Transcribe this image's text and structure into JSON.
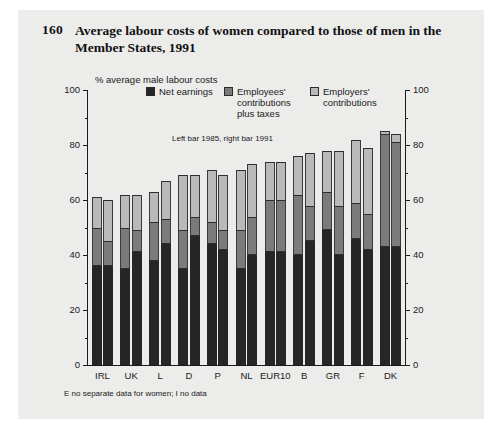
{
  "figure": {
    "number": "160",
    "title": "Average labour costs of women compared to those of men in the Member States, 1991",
    "axis_caption": "% average male labour costs",
    "subnote": "Left bar 1985, right bar 1991",
    "footnote": "E no separate data for women; I no data"
  },
  "legend": {
    "items": [
      {
        "label": "Net earnings",
        "color": "#262626"
      },
      {
        "label": "Employees' contributions plus taxes",
        "color": "#7b7b7b"
      },
      {
        "label": "Employers' contributions",
        "color": "#b9b9b9"
      }
    ]
  },
  "axis": {
    "left_ticks": [
      "100",
      "80",
      "60",
      "40",
      "20",
      "0"
    ],
    "right_ticks": [
      "100",
      "80",
      "60",
      "40",
      "20",
      "0"
    ]
  },
  "chart_data": {
    "type": "bar",
    "title": "Average labour costs of women compared to those of men in the Member States, 1991",
    "subtitle": "Left bar 1985, right bar 1991",
    "xlabel": "",
    "ylabel": "% average male labour costs",
    "ylim": [
      0,
      100
    ],
    "ytick_step": 20,
    "grid": false,
    "stacked": true,
    "legend_position": "top",
    "categories": [
      "IRL",
      "UK",
      "L",
      "D",
      "P",
      "NL",
      "EUR10",
      "B",
      "GR",
      "F",
      "DK"
    ],
    "bar_groups": [
      {
        "category": "IRL",
        "bars": [
          {
            "year": "1985",
            "net_earnings": 36,
            "employees_contributions_plus_taxes": 14,
            "employers_contributions": 11,
            "total": 61
          },
          {
            "year": "1991",
            "net_earnings": 36,
            "employees_contributions_plus_taxes": 9,
            "employers_contributions": 15,
            "total": 60
          }
        ]
      },
      {
        "category": "UK",
        "bars": [
          {
            "year": "1985",
            "net_earnings": 35,
            "employees_contributions_plus_taxes": 15,
            "employers_contributions": 12,
            "total": 62
          },
          {
            "year": "1991",
            "net_earnings": 41,
            "employees_contributions_plus_taxes": 8,
            "employers_contributions": 13,
            "total": 62
          }
        ]
      },
      {
        "category": "L",
        "bars": [
          {
            "year": "1985",
            "net_earnings": 38,
            "employees_contributions_plus_taxes": 14,
            "employers_contributions": 11,
            "total": 63
          },
          {
            "year": "1991",
            "net_earnings": 44,
            "employees_contributions_plus_taxes": 9,
            "employers_contributions": 14,
            "total": 67
          }
        ]
      },
      {
        "category": "D",
        "bars": [
          {
            "year": "1985",
            "net_earnings": 35,
            "employees_contributions_plus_taxes": 14,
            "employers_contributions": 20,
            "total": 69
          },
          {
            "year": "1991",
            "net_earnings": 47,
            "employees_contributions_plus_taxes": 7,
            "employers_contributions": 15,
            "total": 69
          }
        ]
      },
      {
        "category": "P",
        "bars": [
          {
            "year": "1985",
            "net_earnings": 44,
            "employees_contributions_plus_taxes": 8,
            "employers_contributions": 19,
            "total": 71
          },
          {
            "year": "1991",
            "net_earnings": 42,
            "employees_contributions_plus_taxes": 7,
            "employers_contributions": 20,
            "total": 69
          }
        ]
      },
      {
        "category": "NL",
        "bars": [
          {
            "year": "1985",
            "net_earnings": 35,
            "employees_contributions_plus_taxes": 14,
            "employers_contributions": 22,
            "total": 71
          },
          {
            "year": "1991",
            "net_earnings": 40,
            "employees_contributions_plus_taxes": 14,
            "employers_contributions": 19,
            "total": 73
          }
        ]
      },
      {
        "category": "EUR10",
        "bars": [
          {
            "year": "1985",
            "net_earnings": 41,
            "employees_contributions_plus_taxes": 19,
            "employers_contributions": 14,
            "total": 74
          },
          {
            "year": "1991",
            "net_earnings": 41,
            "employees_contributions_plus_taxes": 19,
            "employers_contributions": 14,
            "total": 74
          }
        ]
      },
      {
        "category": "B",
        "bars": [
          {
            "year": "1985",
            "net_earnings": 40,
            "employees_contributions_plus_taxes": 22,
            "employers_contributions": 14,
            "total": 76
          },
          {
            "year": "1991",
            "net_earnings": 45,
            "employees_contributions_plus_taxes": 13,
            "employers_contributions": 19,
            "total": 77
          }
        ]
      },
      {
        "category": "GR",
        "bars": [
          {
            "year": "1985",
            "net_earnings": 49,
            "employees_contributions_plus_taxes": 14,
            "employers_contributions": 15,
            "total": 78
          },
          {
            "year": "1991",
            "net_earnings": 40,
            "employees_contributions_plus_taxes": 18,
            "employers_contributions": 20,
            "total": 78
          }
        ]
      },
      {
        "category": "F",
        "bars": [
          {
            "year": "1985",
            "net_earnings": 46,
            "employees_contributions_plus_taxes": 13,
            "employers_contributions": 23,
            "total": 82
          },
          {
            "year": "1991",
            "net_earnings": 42,
            "employees_contributions_plus_taxes": 13,
            "employers_contributions": 24,
            "total": 79
          }
        ]
      },
      {
        "category": "DK",
        "bars": [
          {
            "year": "1985",
            "net_earnings": 43,
            "employees_contributions_plus_taxes": 41,
            "employers_contributions": 1,
            "total": 85
          },
          {
            "year": "1991",
            "net_earnings": 43,
            "employees_contributions_plus_taxes": 38,
            "employers_contributions": 3,
            "total": 84
          }
        ]
      }
    ]
  }
}
